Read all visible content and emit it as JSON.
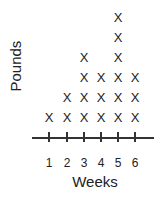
{
  "chart_data": {
    "type": "dot_plot",
    "title": "",
    "xlabel": "Weeks",
    "ylabel": "Pounds",
    "categories": [
      "1",
      "2",
      "3",
      "4",
      "5",
      "6"
    ],
    "values": [
      1,
      2,
      4,
      3,
      6,
      3
    ],
    "marker": "X",
    "grid": false
  }
}
